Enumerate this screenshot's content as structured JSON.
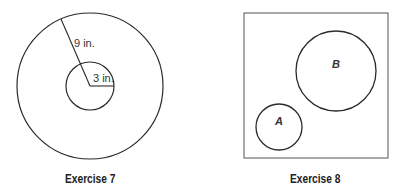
{
  "figures": [
    {
      "caption": "Exercise 7",
      "outer_radius_label": "9 in.",
      "inner_radius_label": "3 in.",
      "outer_circle": {
        "cx": 90,
        "cy": 86,
        "r": 73
      },
      "inner_circle": {
        "cx": 90,
        "cy": 86,
        "r": 24
      }
    },
    {
      "caption": "Exercise 8",
      "box": {
        "x": 244,
        "y": 13,
        "w": 144,
        "h": 145
      },
      "circle_a": {
        "label": "A",
        "cx": 279,
        "cy": 127,
        "r": 23
      },
      "circle_b": {
        "label": "B",
        "cx": 336,
        "cy": 71,
        "r": 40
      }
    }
  ],
  "colors": {
    "stroke": "#2a2a2a",
    "text": "#222222",
    "background": "#ffffff"
  }
}
